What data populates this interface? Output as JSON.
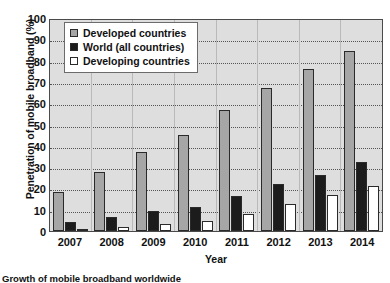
{
  "chart_data": {
    "type": "bar",
    "title": "",
    "xlabel": "Year",
    "ylabel": "Penetration of mobile broadband (%)",
    "categories": [
      "2007",
      "2008",
      "2009",
      "2010",
      "2011",
      "2012",
      "2013",
      "2014"
    ],
    "series": [
      {
        "name": "Developed countries",
        "color": "#a6a6a6",
        "values": [
          18.5,
          27.5,
          37,
          45,
          57,
          67,
          76,
          84.5
        ]
      },
      {
        "name": "World (all countries)",
        "color": "#1c1c1c",
        "values": [
          4,
          6.5,
          9.5,
          11.5,
          16.5,
          22,
          26.5,
          32.5
        ]
      },
      {
        "name": "Developing countries",
        "color": "#ffffff",
        "values": [
          1,
          1.8,
          3.5,
          4.5,
          8,
          12.5,
          17,
          21
        ]
      }
    ],
    "ylim": [
      0,
      100
    ],
    "yticks": [
      100,
      90,
      80,
      70,
      60,
      50,
      40,
      30,
      20,
      10,
      0
    ],
    "grid": true,
    "legend_position": "top-left",
    "plot_background": "#dedede"
  },
  "caption": {
    "text": "Growth of mobile broadband worldwide"
  }
}
